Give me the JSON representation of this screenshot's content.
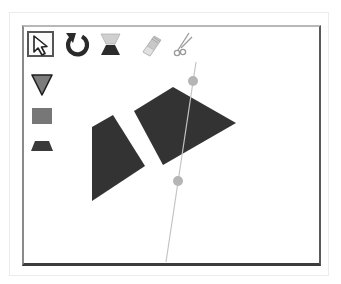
{
  "app": {
    "type": "geometric shape cutting puzzle"
  },
  "toolbar": {
    "tools": [
      {
        "id": "select",
        "icon": "arrow-cursor-icon",
        "selected": true
      },
      {
        "id": "rotate",
        "icon": "rotate-icon",
        "selected": false
      },
      {
        "id": "flip",
        "icon": "flip-icon",
        "selected": false
      },
      {
        "id": "erase",
        "icon": "eraser-icon",
        "selected": false
      },
      {
        "id": "cut",
        "icon": "scissors-icon",
        "selected": false
      }
    ]
  },
  "palette": {
    "shapes": [
      {
        "id": "triangle",
        "icon": "triangle-icon",
        "color": "#7a7a7a"
      },
      {
        "id": "square",
        "icon": "square-icon",
        "color": "#7a7a7a"
      },
      {
        "id": "trapezoid",
        "icon": "trapezoid-icon",
        "color": "#4a4a4a"
      }
    ]
  },
  "canvas": {
    "shapes": [
      {
        "name": "left-quadrilateral",
        "color": "#333333",
        "points": "92,127 113,115 145,166 92,201"
      },
      {
        "name": "right-quadrilateral",
        "color": "#333333",
        "points": "134,111 173,87 236,123 163,165"
      }
    ],
    "cut_line": {
      "x1": 196,
      "y1": 62,
      "x2": 166,
      "y2": 262,
      "color": "#c8c8c8"
    },
    "handles": [
      {
        "cx": 193,
        "cy": 81,
        "r": 5,
        "color": "#b8b8b8"
      },
      {
        "cx": 178,
        "cy": 181,
        "r": 5,
        "color": "#b8b8b8"
      }
    ]
  }
}
